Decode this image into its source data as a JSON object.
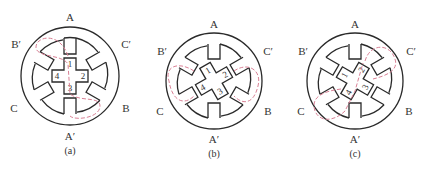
{
  "figure": {
    "panels": [
      {
        "id": "a",
        "caption": "(a)",
        "center": [
          70,
          76
        ],
        "rotor_angle": 0,
        "poles": {
          "top": "A",
          "bottom": "A′",
          "top_left": "B′",
          "top_right": "C′",
          "bottom_left": "C",
          "bottom_right": "B"
        },
        "rotor_teeth": [
          "1",
          "2",
          "3",
          "4"
        ],
        "flux_path": "A–A′"
      },
      {
        "id": "b",
        "caption": "(b)",
        "center": [
          214,
          81
        ],
        "rotor_angle": -30,
        "poles": {
          "top": "A",
          "bottom": "A′",
          "top_left": "B′",
          "top_right": "C′",
          "bottom_left": "C",
          "bottom_right": "B"
        },
        "rotor_teeth": [
          "1",
          "2",
          "3",
          "4"
        ],
        "flux_path": "C–C′"
      },
      {
        "id": "c",
        "caption": "(c)",
        "center": [
          355,
          81
        ],
        "rotor_angle": -60,
        "poles": {
          "top": "A",
          "bottom": "A′",
          "top_left": "B′",
          "top_right": "C′",
          "bottom_left": "C",
          "bottom_right": "B"
        },
        "rotor_teeth": [
          "1",
          "2",
          "3",
          "4"
        ],
        "flux_path": "B–B′"
      }
    ],
    "colors": {
      "outline": "#2a2a2a",
      "flux": "#d98095"
    }
  }
}
